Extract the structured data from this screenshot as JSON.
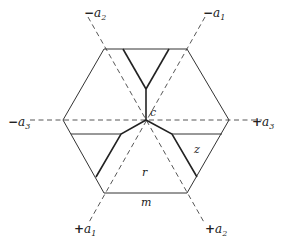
{
  "diagram": {
    "center": {
      "x": 146,
      "y": 120
    },
    "hexagon": [
      [
        63,
        120
      ],
      [
        104,
        49
      ],
      [
        187,
        49
      ],
      [
        229,
        120
      ],
      [
        187,
        193
      ],
      [
        104,
        193
      ]
    ],
    "axes": [
      {
        "from": [
          88,
          17
        ],
        "to": [
          205,
          224
        ],
        "neg_label": "a2",
        "pos_label": "a2"
      },
      {
        "from": [
          205,
          17
        ],
        "to": [
          88,
          224
        ],
        "neg_label": "a1",
        "pos_label": "a1"
      },
      {
        "from": [
          30,
          120
        ],
        "to": [
          262,
          120
        ],
        "neg_label": "a3",
        "pos_label": "a3"
      }
    ],
    "axis_labels": [
      {
        "sign": "−",
        "name": "a",
        "sub": "2",
        "x": 84,
        "y": 17
      },
      {
        "sign": "−",
        "name": "a",
        "sub": "1",
        "x": 203,
        "y": 17
      },
      {
        "sign": "−",
        "name": "a",
        "sub": "3",
        "x": 8,
        "y": 126
      },
      {
        "sign": "+",
        "name": "a",
        "sub": "3",
        "x": 252,
        "y": 126
      },
      {
        "sign": "+",
        "name": "a",
        "sub": "1",
        "x": 74,
        "y": 233
      },
      {
        "sign": "+",
        "name": "a",
        "sub": "2",
        "x": 205,
        "y": 233
      }
    ],
    "region_labels": [
      {
        "text": "c",
        "x": 150,
        "y": 116
      },
      {
        "text": "r",
        "x": 142,
        "y": 176
      },
      {
        "text": "z",
        "x": 194,
        "y": 153
      },
      {
        "text": "m",
        "x": 141,
        "y": 206
      }
    ]
  }
}
